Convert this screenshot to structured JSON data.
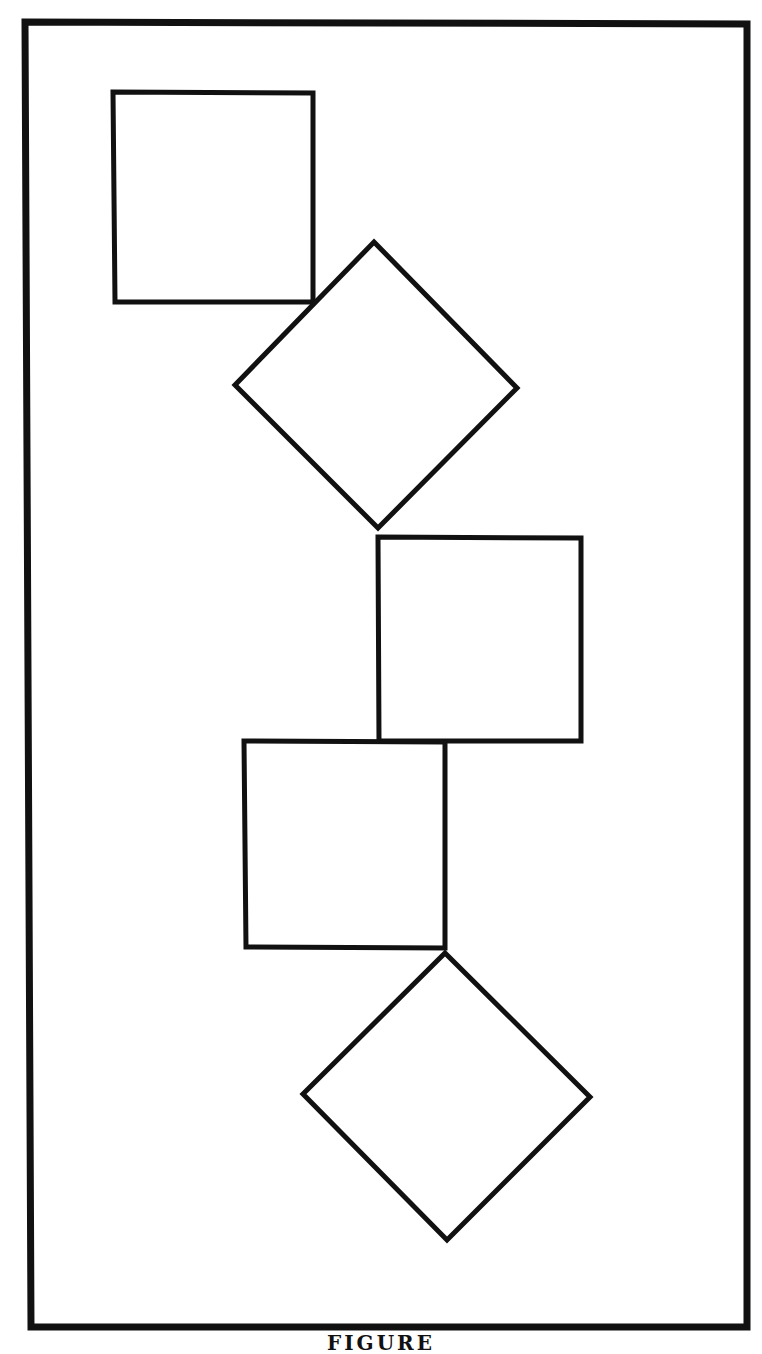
{
  "figure": {
    "caption": "FIGURE",
    "stroke_color": "#111111",
    "background": "#ffffff",
    "frame": {
      "points": "25,22 747,24 747,1327 31,1327",
      "stroke_width": 7
    },
    "shapes": [
      {
        "id": "square-1",
        "type": "square",
        "points": "113,92 313,93 313,302 115,302"
      },
      {
        "id": "diamond-1",
        "type": "diamond",
        "points": "374,242 517,388 378,528 235,385"
      },
      {
        "id": "square-2",
        "type": "square",
        "points": "378,537 581,538 581,741 379,741"
      },
      {
        "id": "square-3",
        "type": "square",
        "points": "244,741 445,742 445,948 246,947"
      },
      {
        "id": "diamond-2",
        "type": "diamond",
        "points": "445,953 590,1097 447,1240 303,1094"
      }
    ],
    "shape_stroke_width": 5
  }
}
